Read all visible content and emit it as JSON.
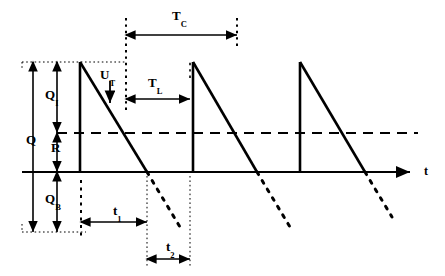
{
  "figure": {
    "type": "signal-waveform-diagram",
    "background_color": "#ffffff",
    "line_color": "#000000"
  },
  "axes": {
    "time_axis_label": "t",
    "time_axis_y": 172,
    "time_axis_x_start": 22,
    "time_axis_x_end": 418,
    "threshold_line_y": 133,
    "top_level_y": 62,
    "bottom_level_y": 232
  },
  "vertical_labels": [
    {
      "name": "total-charge",
      "base": "Q",
      "sub": "",
      "x": 26,
      "y": 140,
      "arrow_x": 33,
      "arrow_top": 62,
      "arrow_bottom": 232
    },
    {
      "name": "information-charge",
      "base": "Q",
      "sub": "I",
      "x": 47,
      "y": 95,
      "arrow_x": 57,
      "arrow_top": 62,
      "arrow_bottom": 133
    },
    {
      "name": "residual-charge",
      "base": "R",
      "sub": "",
      "x": 52,
      "y": 147,
      "arrow_x": 57,
      "arrow_top": 133,
      "arrow_bottom": 172
    },
    {
      "name": "background-charge",
      "base": "Q",
      "sub": "B",
      "x": 47,
      "y": 199,
      "arrow_x": 57,
      "arrow_top": 172,
      "arrow_bottom": 232
    }
  ],
  "horizontal_intervals": [
    {
      "name": "cycle-time",
      "base": "T",
      "sub": "C",
      "label_x": 172,
      "label_y": 12,
      "arrow_y": 35,
      "arrow_x_start": 126,
      "arrow_x_end": 237
    },
    {
      "name": "load-time",
      "base": "T",
      "sub": "L",
      "label_x": 148,
      "label_y": 80,
      "arrow_y": 99,
      "arrow_x_start": 126,
      "arrow_x_end": 190
    },
    {
      "name": "t1-interval",
      "base": "t",
      "sub": "1",
      "label_x": 113,
      "label_y": 205,
      "arrow_y": 222,
      "arrow_x_start": 81,
      "arrow_x_end": 147
    },
    {
      "name": "t2-interval",
      "base": "t",
      "sub": "2",
      "label_x": 166,
      "label_y": 241,
      "arrow_y": 259,
      "arrow_x_start": 147,
      "arrow_x_end": 190
    }
  ],
  "point_labels": [
    {
      "name": "threshold-voltage",
      "base": "U",
      "sub": "T",
      "label_x": 101,
      "label_y": 73,
      "arrow_x": 110,
      "arrow_y_start": 81,
      "arrow_y_end": 103
    }
  ],
  "waveform": {
    "name": "sawtooth-charge-signal",
    "peak_y": 62,
    "period_px": 107,
    "rise_x_positions": [
      80,
      193,
      300
    ],
    "fall_end_x_positions": [
      147,
      257,
      365
    ],
    "solid_fall_end_y": 172,
    "dotted_extension_end_y": 232
  },
  "reference_lines": {
    "dotted_vertical_x": [
      22,
      57,
      80,
      126,
      147,
      190,
      237
    ],
    "top_dotted_y": 62,
    "bottom_dotted_y": 232
  }
}
